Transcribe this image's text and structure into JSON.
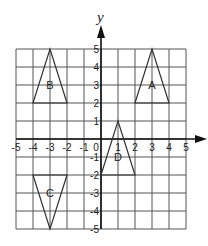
{
  "diagram": {
    "type": "coordinate-grid",
    "axes": {
      "x_label": "",
      "y_label": "y",
      "x_range": [
        -5,
        5
      ],
      "y_range": [
        -5,
        5
      ],
      "x_ticks": [
        "-5",
        "-4",
        "-3",
        "-2",
        "-1",
        "0",
        "1",
        "2",
        "3",
        "4",
        "5"
      ],
      "y_ticks": [
        "5",
        "4",
        "3",
        "2",
        "1",
        "-1",
        "-2",
        "-3",
        "-4",
        "-5"
      ],
      "grid": true
    },
    "shapes": [
      {
        "label": "A",
        "type": "triangle",
        "vertices": [
          [
            2,
            2
          ],
          [
            3,
            5
          ],
          [
            4,
            2
          ]
        ]
      },
      {
        "label": "B",
        "type": "triangle",
        "vertices": [
          [
            -4,
            2
          ],
          [
            -3,
            5
          ],
          [
            -2,
            2
          ]
        ]
      },
      {
        "label": "C",
        "type": "triangle",
        "vertices": [
          [
            -4,
            -2
          ],
          [
            -3,
            -5
          ],
          [
            -2,
            -2
          ]
        ]
      },
      {
        "label": "D",
        "type": "triangle",
        "vertices": [
          [
            0,
            -2
          ],
          [
            1,
            1
          ],
          [
            2,
            -2
          ]
        ]
      }
    ],
    "colors": {
      "grid": "#555555",
      "axis": "#111111",
      "shape": "#333333"
    }
  }
}
